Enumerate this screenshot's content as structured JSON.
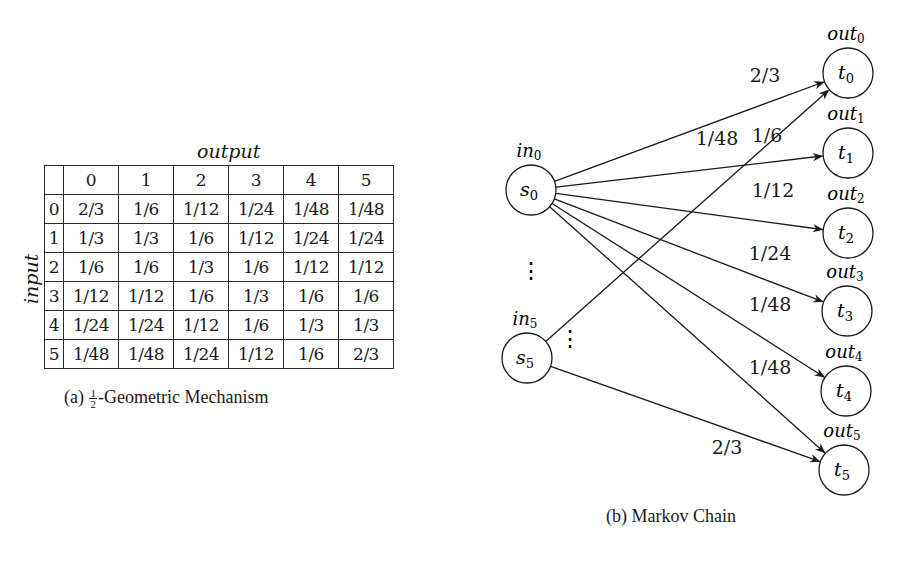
{
  "panel_a": {
    "caption_prefix": "(a) ",
    "caption_frac_num": "1",
    "caption_frac_den": "2",
    "caption_suffix": "-Geometric Mechanism",
    "column_axis_label": "output",
    "row_axis_label": "input",
    "column_headers": [
      "0",
      "1",
      "2",
      "3",
      "4",
      "5"
    ],
    "rows": [
      {
        "label": "0",
        "cells": [
          "2/3",
          "1/6",
          "1/12",
          "1/24",
          "1/48",
          "1/48"
        ]
      },
      {
        "label": "1",
        "cells": [
          "1/3",
          "1/3",
          "1/6",
          "1/12",
          "1/24",
          "1/24"
        ]
      },
      {
        "label": "2",
        "cells": [
          "1/6",
          "1/6",
          "1/3",
          "1/6",
          "1/12",
          "1/12"
        ]
      },
      {
        "label": "3",
        "cells": [
          "1/12",
          "1/12",
          "1/6",
          "1/3",
          "1/6",
          "1/6"
        ]
      },
      {
        "label": "4",
        "cells": [
          "1/24",
          "1/24",
          "1/12",
          "1/6",
          "1/3",
          "1/3"
        ]
      },
      {
        "label": "5",
        "cells": [
          "1/48",
          "1/48",
          "1/24",
          "1/12",
          "1/6",
          "2/3"
        ]
      }
    ]
  },
  "panel_b": {
    "caption": "(b) Markov Chain",
    "input_nodes": [
      {
        "id": "s0",
        "name": "s",
        "sub": "0",
        "label": "in",
        "label_sub": "0"
      },
      {
        "id": "s5",
        "name": "s",
        "sub": "5",
        "label": "in",
        "label_sub": "5"
      }
    ],
    "output_nodes": [
      {
        "id": "t0",
        "name": "t",
        "sub": "0",
        "label": "out",
        "label_sub": "0"
      },
      {
        "id": "t1",
        "name": "t",
        "sub": "1",
        "label": "out",
        "label_sub": "1"
      },
      {
        "id": "t2",
        "name": "t",
        "sub": "2",
        "label": "out",
        "label_sub": "2"
      },
      {
        "id": "t3",
        "name": "t",
        "sub": "3",
        "label": "out",
        "label_sub": "3"
      },
      {
        "id": "t4",
        "name": "t",
        "sub": "4",
        "label": "out",
        "label_sub": "4"
      },
      {
        "id": "t5",
        "name": "t",
        "sub": "5",
        "label": "out",
        "label_sub": "5"
      }
    ],
    "edges": [
      {
        "from": "s0",
        "to": "t0",
        "label": "2/3"
      },
      {
        "from": "s0",
        "to": "t1",
        "label": "1/6"
      },
      {
        "from": "s0",
        "to": "t2",
        "label": "1/12"
      },
      {
        "from": "s0",
        "to": "t3",
        "label": "1/24"
      },
      {
        "from": "s0",
        "to": "t4",
        "label": "1/48"
      },
      {
        "from": "s0",
        "to": "t5",
        "label": "1/48"
      },
      {
        "from": "s5",
        "to": "t0",
        "label": "1/48"
      },
      {
        "from": "s5",
        "to": "t5",
        "label": "2/3"
      }
    ],
    "ellipsis": "⋮"
  }
}
